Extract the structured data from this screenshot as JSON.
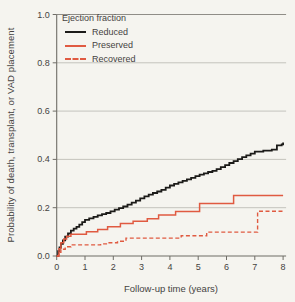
{
  "figure": {
    "background": "#f5f4ef",
    "legend": {
      "title": "Ejection fraction",
      "entries": [
        {
          "label": "Reduced",
          "color": "#1c1b19",
          "dash": "solid"
        },
        {
          "label": "Preserved",
          "color": "#e05a41",
          "dash": "solid"
        },
        {
          "label": "Recovered",
          "color": "#e05a41",
          "dash": "dashed"
        }
      ]
    },
    "colors": {
      "grid": "#bfbdb7",
      "frame": "#8f8d87",
      "axis": "#6f6d67",
      "text": "#45433f"
    }
  },
  "chart_data": {
    "type": "line",
    "subtype": "kaplan-meier-step",
    "title": "",
    "xlabel": "Follow-up time  (years)",
    "ylabel": "Probability of death, transplant, or VAD placement",
    "xlim": [
      0,
      8
    ],
    "ylim": [
      0,
      1.0
    ],
    "x_ticks": [
      "0",
      "1",
      "2",
      "3",
      "4",
      "5",
      "6",
      "7",
      "8"
    ],
    "y_ticks": [
      "0.0",
      "0.2",
      "0.4",
      "0.6",
      "0.8",
      "1.0"
    ],
    "grid": "horizontal",
    "legend_position": "top-left",
    "legend_title": "Ejection fraction",
    "series": [
      {
        "name": "Reduced",
        "color": "#1c1b19",
        "style": "solid",
        "width": 1.8,
        "step": true,
        "points": [
          [
            0,
            0
          ],
          [
            0.05,
            0.02
          ],
          [
            0.1,
            0.035
          ],
          [
            0.15,
            0.05
          ],
          [
            0.22,
            0.065
          ],
          [
            0.3,
            0.08
          ],
          [
            0.4,
            0.093
          ],
          [
            0.5,
            0.105
          ],
          [
            0.6,
            0.113
          ],
          [
            0.7,
            0.121
          ],
          [
            0.8,
            0.13
          ],
          [
            0.9,
            0.14
          ],
          [
            1.0,
            0.15
          ],
          [
            1.15,
            0.156
          ],
          [
            1.3,
            0.162
          ],
          [
            1.45,
            0.168
          ],
          [
            1.6,
            0.173
          ],
          [
            1.75,
            0.178
          ],
          [
            1.9,
            0.185
          ],
          [
            2.05,
            0.192
          ],
          [
            2.2,
            0.198
          ],
          [
            2.35,
            0.205
          ],
          [
            2.5,
            0.213
          ],
          [
            2.65,
            0.221
          ],
          [
            2.8,
            0.229
          ],
          [
            2.95,
            0.239
          ],
          [
            3.1,
            0.247
          ],
          [
            3.25,
            0.254
          ],
          [
            3.4,
            0.261
          ],
          [
            3.55,
            0.267
          ],
          [
            3.7,
            0.274
          ],
          [
            3.85,
            0.283
          ],
          [
            4.0,
            0.292
          ],
          [
            4.15,
            0.299
          ],
          [
            4.3,
            0.305
          ],
          [
            4.45,
            0.311
          ],
          [
            4.6,
            0.317
          ],
          [
            4.75,
            0.324
          ],
          [
            4.9,
            0.331
          ],
          [
            5.05,
            0.337
          ],
          [
            5.2,
            0.342
          ],
          [
            5.35,
            0.348
          ],
          [
            5.5,
            0.353
          ],
          [
            5.65,
            0.36
          ],
          [
            5.8,
            0.368
          ],
          [
            5.95,
            0.376
          ],
          [
            6.1,
            0.385
          ],
          [
            6.25,
            0.393
          ],
          [
            6.4,
            0.401
          ],
          [
            6.55,
            0.409
          ],
          [
            6.7,
            0.417
          ],
          [
            6.85,
            0.424
          ],
          [
            7.0,
            0.432
          ],
          [
            7.3,
            0.436
          ],
          [
            7.6,
            0.44
          ],
          [
            7.78,
            0.458
          ],
          [
            7.95,
            0.462
          ],
          [
            8.0,
            0.47
          ]
        ]
      },
      {
        "name": "Preserved",
        "color": "#e05a41",
        "style": "solid",
        "width": 1.5,
        "step": true,
        "points": [
          [
            0,
            0
          ],
          [
            0.08,
            0.03
          ],
          [
            0.15,
            0.055
          ],
          [
            0.25,
            0.07
          ],
          [
            0.35,
            0.082
          ],
          [
            0.5,
            0.09
          ],
          [
            1.05,
            0.1
          ],
          [
            1.45,
            0.11
          ],
          [
            1.8,
            0.121
          ],
          [
            2.25,
            0.134
          ],
          [
            2.7,
            0.144
          ],
          [
            3.2,
            0.154
          ],
          [
            3.6,
            0.17
          ],
          [
            4.2,
            0.184
          ],
          [
            5.05,
            0.218
          ],
          [
            6.25,
            0.25
          ],
          [
            8.0,
            0.25
          ]
        ]
      },
      {
        "name": "Recovered",
        "color": "#e05a41",
        "style": "dashed",
        "width": 1.4,
        "step": true,
        "points": [
          [
            0,
            0
          ],
          [
            0.07,
            0.015
          ],
          [
            0.15,
            0.028
          ],
          [
            0.3,
            0.038
          ],
          [
            0.5,
            0.046
          ],
          [
            1.55,
            0.05
          ],
          [
            1.85,
            0.055
          ],
          [
            2.15,
            0.061
          ],
          [
            2.45,
            0.074
          ],
          [
            4.4,
            0.084
          ],
          [
            5.3,
            0.099
          ],
          [
            7.1,
            0.185
          ],
          [
            8.0,
            0.185
          ]
        ]
      }
    ]
  }
}
